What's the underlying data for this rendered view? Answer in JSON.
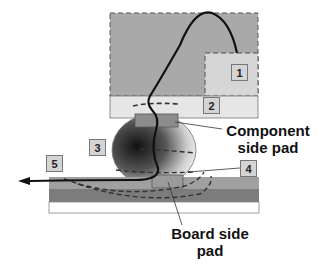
{
  "diagram": {
    "labels": {
      "component_pad": "Component\nside pad",
      "component_pad_line1": "Component",
      "component_pad_line2": "side pad",
      "board_pad_line1": "Board side",
      "board_pad_line2": "pad"
    },
    "markers": [
      "1",
      "2",
      "3",
      "4",
      "5"
    ],
    "colors": {
      "component": "#a9a9a9",
      "box1": "#d6d6d6",
      "layer2": "#e6e6e6",
      "pad": "#8c8c8c",
      "board_top": "#a0a0a0",
      "board_dark": "#7c7c7c",
      "marker_bg": "#d4d4d4"
    }
  }
}
